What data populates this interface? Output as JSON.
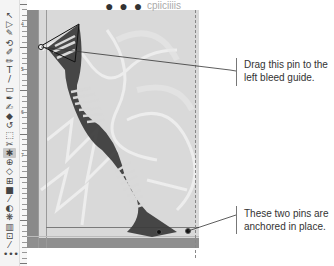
{
  "toolbar": {
    "tools": [
      {
        "name": "selection-tool",
        "glyph": "↖"
      },
      {
        "name": "direct-selection-tool",
        "glyph": "▷"
      },
      {
        "name": "pen-tool",
        "glyph": "✎"
      },
      {
        "name": "lasso-tool",
        "glyph": "⟲"
      },
      {
        "name": "brush-tool",
        "glyph": "✐"
      },
      {
        "name": "pencil-tool",
        "glyph": "✏"
      },
      {
        "name": "type-tool",
        "glyph": "T"
      },
      {
        "name": "line-tool",
        "glyph": "/"
      },
      {
        "name": "rectangle-tool",
        "glyph": "▭"
      },
      {
        "name": "paintbrush-tool",
        "glyph": "✒"
      },
      {
        "name": "blob-brush-tool",
        "glyph": "✍"
      },
      {
        "name": "eraser-tool",
        "glyph": "◆"
      },
      {
        "name": "rotate-tool",
        "glyph": "↺"
      },
      {
        "name": "scale-tool",
        "glyph": "⬚"
      },
      {
        "name": "warp-tool",
        "glyph": "✂"
      },
      {
        "name": "puppet-warp-tool",
        "glyph": "✱"
      },
      {
        "name": "shape-builder-tool",
        "glyph": "⊕"
      },
      {
        "name": "perspective-tool",
        "glyph": "◇"
      },
      {
        "name": "mesh-tool",
        "glyph": "⊞"
      },
      {
        "name": "gradient-tool",
        "glyph": "■"
      },
      {
        "name": "eyedropper-tool",
        "glyph": "⁄"
      },
      {
        "name": "blend-tool",
        "glyph": "◐"
      },
      {
        "name": "symbol-sprayer-tool",
        "glyph": "❋"
      },
      {
        "name": "graph-tool",
        "glyph": "▥"
      },
      {
        "name": "artboard-tool",
        "glyph": "⊡"
      },
      {
        "name": "slice-tool",
        "glyph": "⁄"
      },
      {
        "name": "more-tools",
        "glyph": "•••"
      }
    ],
    "active_index": 15
  },
  "ruler": {
    "labels": [
      "4",
      "5",
      "6",
      "7"
    ]
  },
  "canvas": {
    "header_text": "cpiiciiiis"
  },
  "callouts": [
    {
      "text_line1": "Drag this pin to the",
      "text_line2": "left bleed guide."
    },
    {
      "text_line1": "These two pins are",
      "text_line2": "anchored in place."
    }
  ],
  "colors": {
    "bleed": "#8a8a8a",
    "artwork": "#3a3a3a",
    "page": "#d9d9d9"
  }
}
